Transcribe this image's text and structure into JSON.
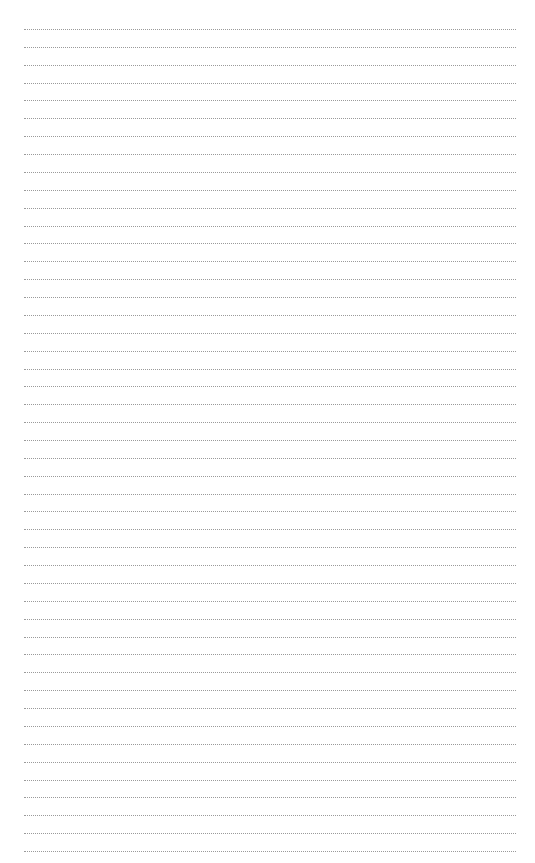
{
  "page": {
    "type": "dotted-lined-paper",
    "line_count": 47,
    "first_line_y": 29,
    "line_spacing": 17.87,
    "line_left": 24,
    "line_width": 492,
    "line_color": "#9a9a9a",
    "background": "#ffffff"
  }
}
